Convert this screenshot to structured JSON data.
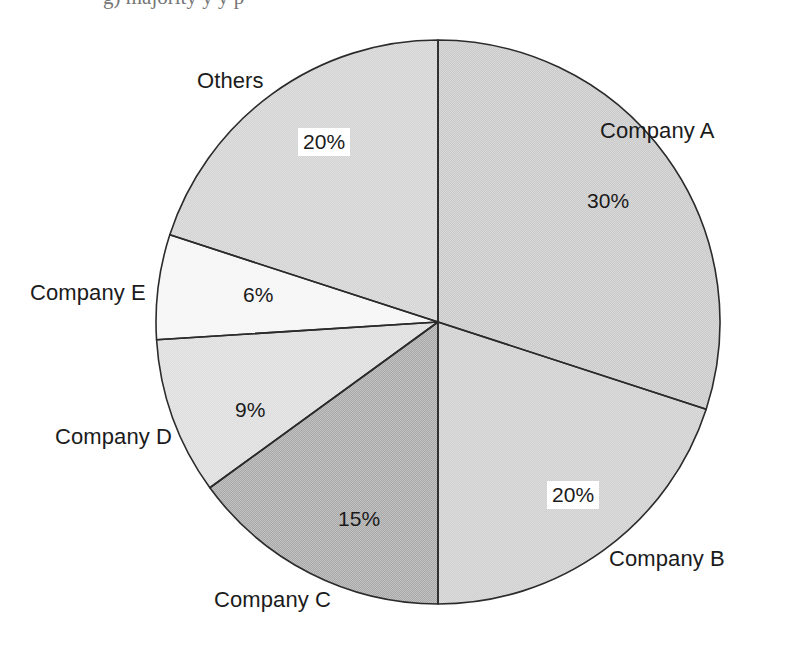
{
  "chart_data": {
    "type": "pie",
    "title": "",
    "subtitle": "",
    "xlabel": "",
    "ylabel": "",
    "legend_position": "none",
    "grid": false,
    "units": "percent",
    "start_angle_deg": 0,
    "direction": "clockwise",
    "categories": [
      "Company A",
      "Company B",
      "Company C",
      "Company D",
      "Company E",
      "Others"
    ],
    "values": [
      30,
      20,
      15,
      9,
      6,
      20
    ],
    "value_labels": [
      "30%",
      "20%",
      "15%",
      "9%",
      "6%",
      "20%"
    ],
    "slices": [
      {
        "name": "Company A",
        "value": 30,
        "value_label": "30%",
        "color": "#c9c9c9",
        "label_boxed": false
      },
      {
        "name": "Company B",
        "value": 20,
        "value_label": "20%",
        "color": "#cfcfcf",
        "label_boxed": true
      },
      {
        "name": "Company C",
        "value": 15,
        "value_label": "15%",
        "color": "#a8a8a8",
        "label_boxed": false
      },
      {
        "name": "Company D",
        "value": 9,
        "value_label": "9%",
        "color": "#dddddd",
        "label_boxed": false
      },
      {
        "name": "Company E",
        "value": 6,
        "value_label": "6%",
        "color": "#f5f5f5",
        "label_boxed": false
      },
      {
        "name": "Others",
        "value": 20,
        "value_label": "20%",
        "color": "#d2d2d2",
        "label_boxed": true
      }
    ],
    "geometry": {
      "center_x": 438,
      "center_y": 322,
      "radius": 282,
      "outline_color": "#2b2b2b",
      "outline_width": 1.6,
      "background": "#ffffff"
    },
    "category_label_positions": [
      {
        "name": "Company A",
        "x": 600,
        "y": 120
      },
      {
        "name": "Company B",
        "x": 609,
        "y": 548
      },
      {
        "name": "Company C",
        "x": 214,
        "y": 589
      },
      {
        "name": "Company D",
        "x": 55,
        "y": 426
      },
      {
        "name": "Company E",
        "x": 30,
        "y": 282
      },
      {
        "name": "Others",
        "x": 197,
        "y": 70
      }
    ],
    "value_label_positions": [
      {
        "name": "Company A",
        "x": 587,
        "y": 190
      },
      {
        "name": "Company B",
        "x": 547,
        "y": 481
      },
      {
        "name": "Company C",
        "x": 338,
        "y": 508
      },
      {
        "name": "Company D",
        "x": 235,
        "y": 399
      },
      {
        "name": "Company E",
        "x": 243,
        "y": 284
      },
      {
        "name": "Others",
        "x": 298,
        "y": 128
      }
    ]
  },
  "top_caption": {
    "text": "g) majority                 y                                        y                  p"
  }
}
